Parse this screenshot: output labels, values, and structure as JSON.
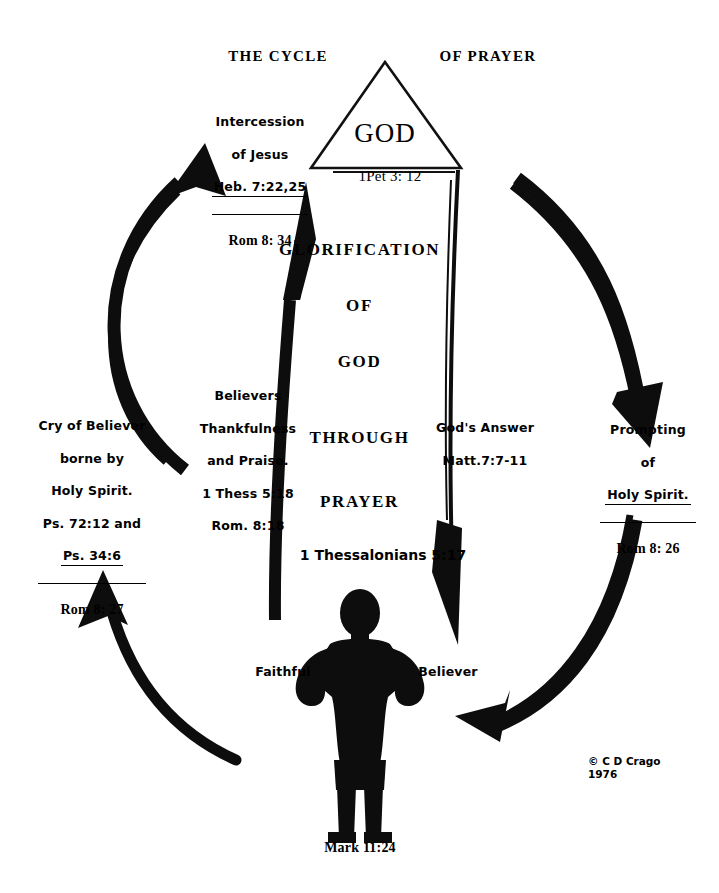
{
  "diagram": {
    "title_left": "THE CYCLE",
    "title_right": "OF PRAYER",
    "deity": {
      "name": "GOD",
      "reference": "1Pet 3: 12"
    },
    "center_lines": [
      "GLORIFICATION",
      "OF",
      "GOD",
      "THROUGH",
      "PRAYER"
    ],
    "center_reference": "1 Thessalonians 5:17",
    "figure": {
      "label_left": "Faithful",
      "label_right": "Believer",
      "reference": "Mark 11:24"
    },
    "copyright": {
      "symbol": "©",
      "holder": "C D Crago",
      "year": "1976"
    },
    "nodes": [
      {
        "id": "intercession",
        "lines": [
          "Intercession",
          "of Jesus",
          "Heb. 7:22,25"
        ],
        "underlined_line": "Heb. 7:22,25",
        "footer": "Rom 8: 34"
      },
      {
        "id": "prompting",
        "lines": [
          "Prompting",
          "of",
          "Holy Spirit."
        ],
        "underlined_line": "Holy Spirit.",
        "footer": "Rom 8: 26"
      },
      {
        "id": "gods-answer",
        "lines": [
          "God's Answer",
          "Matt.7:7-11"
        ],
        "underlined_line": "",
        "footer": ""
      },
      {
        "id": "thankfulness",
        "lines": [
          "Believers",
          "Thankfulness",
          "and Praise.",
          "1 Thess 5:18",
          "Rom. 8:18"
        ],
        "underlined_line": "",
        "footer": ""
      },
      {
        "id": "cry-of-believer",
        "lines": [
          "Cry of Believer",
          "borne by",
          "Holy Spirit.",
          "Ps. 72:12 and",
          "Ps. 34:6"
        ],
        "underlined_line": "Ps. 34:6",
        "footer": "Rom 8: 27"
      }
    ],
    "colors": {
      "ink": "#000000",
      "paper": "#ffffff"
    }
  }
}
